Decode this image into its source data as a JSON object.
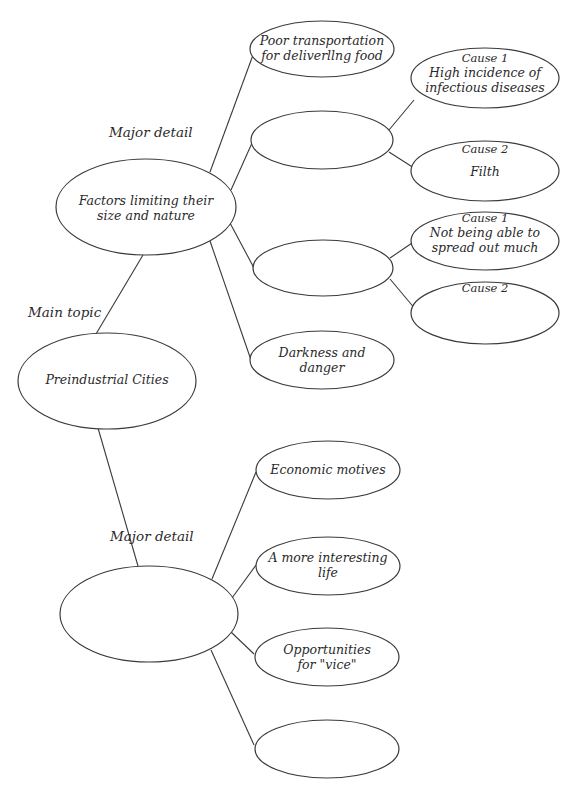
{
  "labels": {
    "main_topic": "Main topic",
    "major_detail_top": "Major detail",
    "major_detail_bottom": "Major detail"
  },
  "nodes": {
    "main": {
      "text": "Preindustrial Cities"
    },
    "factors": {
      "text": "Factors limiting their\nsize and nature"
    },
    "poor_transport": {
      "text": "Poor transportation\nfor deliverllng food"
    },
    "blank_a": {
      "text": ""
    },
    "blank_a_cause1": {
      "tag": "Cause 1",
      "text": "High incidence of\ninfectious diseases"
    },
    "blank_a_cause2": {
      "tag": "Cause 2",
      "text": "Filth"
    },
    "blank_b": {
      "text": ""
    },
    "blank_b_cause1": {
      "tag": "Cause 1",
      "text": "Not being able to\nspread out much"
    },
    "blank_b_cause2": {
      "tag": "Cause 2",
      "text": ""
    },
    "darkness": {
      "text": "Darkness and\ndanger"
    },
    "major_blank": {
      "text": ""
    },
    "economic": {
      "text": "Economic motives"
    },
    "interesting_life": {
      "text": "A more interesting\nlife"
    },
    "vice": {
      "text": "Opportunities\nfor \"vice\""
    },
    "bottom_blank": {
      "text": ""
    }
  },
  "colors": {
    "stroke": "#3a3a3a",
    "text": "#2a2a2a",
    "background": "#ffffff"
  }
}
